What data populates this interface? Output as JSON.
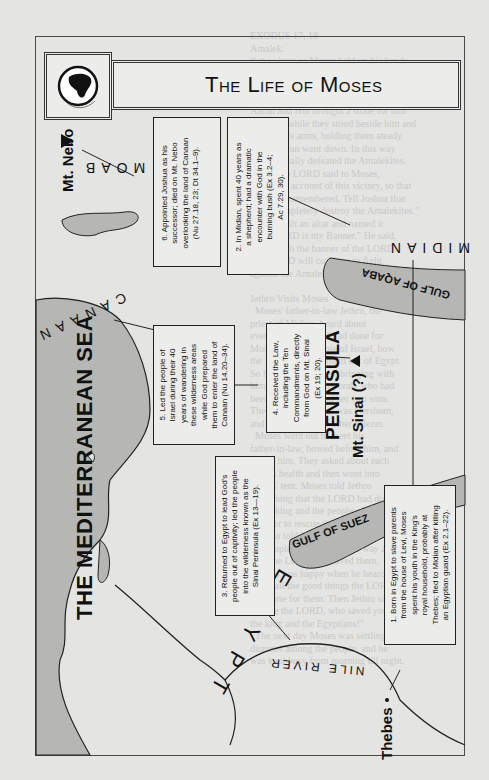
{
  "title": "The Life of Moses",
  "icons": {
    "globe": "globe-icon",
    "mountain": "mountain-triangle-icon"
  },
  "colors": {
    "water": "#b6b6b4",
    "land": "#e4e4e2",
    "ink": "#111111",
    "border": "#4a4a4a"
  },
  "labels": {
    "sea": "THE MEDITERRANEAN SEA",
    "canaan": "CANAAN",
    "moab": "MOAB",
    "midian": "MIDIAN",
    "egypt": "EGYPT",
    "nile": "NILE RIVER",
    "sinai_line1": "SINAI",
    "sinai_line2": "PENINSULA",
    "gulf_suez": "GULF OF SUEZ",
    "gulf_aqaba": "GULF OF AQABA",
    "mt_nebo": "Mt. Nebo",
    "mt_sinai": "Mt. Sinai (?)",
    "thebes": "Thebes"
  },
  "callouts": [
    {
      "number": 1,
      "text": "1. Born in Egypt to slave parents\nfrom the house of Levi, Moses\nspent his youth in the King's\nroyal household, probably at\nThebes; fled to Midian after killing\nan Egyptian guard (Ex 2.1–22)."
    },
    {
      "number": 2,
      "text": "2. In Midian, spent 40 years as\na shepherd; had a dramatic\nencounter with God in the\nburning bush (Ex 3.2–4;\nAc 7.29, 30)."
    },
    {
      "number": 3,
      "text": "3. Returned to Egypt to lead God's\npeople out of captivity; led the people\ninto the wilderness known as the\nSinai Peninsula (Ex 13—19)."
    },
    {
      "number": 4,
      "text": "4. Received the Law,\nincluding the Ten\nCommandments, directly\nfrom God on Mt. Sinai\n(Ex 19; 20)."
    },
    {
      "number": 5,
      "text": "5. Led the people of\nIsrael during their 40\nyears of wandering in\nthese wilderness areas\nwhile God prepared\nthem to enter the land of\nCanaan (Nu 14.20–34)."
    },
    {
      "number": 6,
      "text": "6. Appointed Joshua as his\nsuccessor; died on Mt. Nebo\noverlooking the land of Canaan\n(Nu 27.18, 23; Dt 34.1–9)."
    }
  ],
  "bleed_text": "EXODUS 17, 18\nAmalek.\nthat as long as Moses held up his hands,\nthe Israelites won, but when he put his\narms down, the Amalekites started winning.\n  When Moses' arms grew tired,\nAaron and Hur brought a stone for him\nto sit on, while they stood beside him and\nheld up his arms, holding them steady\nuntil the sun went down. In this way\nJoshua totally defeated the Amalekites.\n  Then the LORD said to Moses,\n\"Write an account of this victory, so that\nit will be remembered. Tell Joshua that\nI will completely destroy the Amalekites.\"\nMoses built an altar and named it\n\"The LORD is my Banner.\" He said,\n\"Hold high the banner of the LORD!\nThe LORD will continue to fight\nagainst the Amalekites forever!\"\n\nJethro Visits Moses\n  Moses' father-in-law Jethro, the\npriest of Midian, heard about\neverything that God had done for\nMoses and the people of Israel, how\nthe LORD had led them out of Egypt.\nSo he came to Moses, bringing with\nhim Moses' wife Zipporah, who had\nbeen left behind, and her two sons.\nThe name of one son was Gershom,\nand the name of the other Eliezer.\n  Moses went out to meet his\nfather-in-law, bowed before him, and\nkissed him. They asked about each\nother's health and then went into\nMoses' tent. Moses told Jethro\neverything that the LORD had done\nto the king and the people of Egypt\nin order to rescue the Israelites.\nHe also told him about the hardships\nthe people had faced on the way and\nhow the LORD had saved them.\n  Jethro was happy when he heard\nabout all the good things the LORD\nhad done for them. Then Jethro said,\n\"Praise the LORD, who saved you from\nthe king and the Egyptians!\"\n  The next day Moses was settling\ndisputes among the people, and he\nwas kept busy from morning till night."
}
